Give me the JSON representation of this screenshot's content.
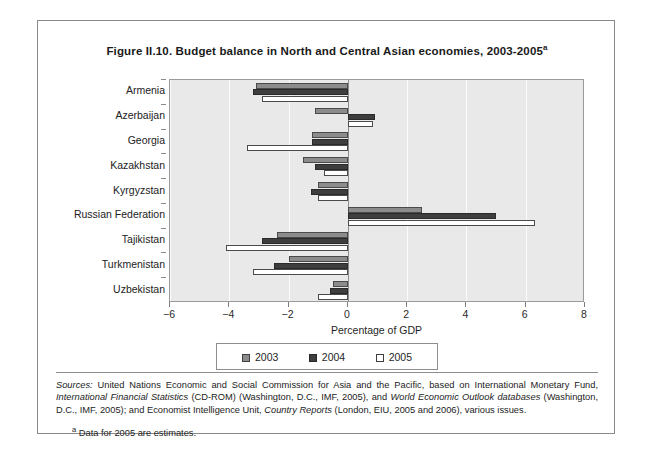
{
  "figure": {
    "title": "Figure II.10. Budget balance in North and Central Asian economies, 2003-2005",
    "title_superscript": "a"
  },
  "chart_data": {
    "type": "bar",
    "orientation": "horizontal",
    "title": "Figure II.10. Budget balance in North and Central Asian economies, 2003-2005",
    "xlabel": "Percentage of GDP",
    "ylabel": "",
    "xlim": [
      -6,
      8
    ],
    "xticks": [
      -6,
      -4,
      -2,
      0,
      2,
      4,
      6,
      8
    ],
    "xtick_labels": [
      "−6",
      "−4",
      "−2",
      "0",
      "2",
      "4",
      "6",
      "8"
    ],
    "grid": true,
    "legend_position": "bottom",
    "categories": [
      "Armenia",
      "Azerbaijan",
      "Georgia",
      "Kazakhstan",
      "Kyrgyzstan",
      "Russian Federation",
      "Tajikistan",
      "Turkmenistan",
      "Uzbekistan"
    ],
    "series": [
      {
        "name": "2003",
        "color": "#8c8c8c",
        "values": [
          -3.1,
          -1.1,
          -1.2,
          -1.5,
          -1.0,
          2.5,
          -2.4,
          -2.0,
          -0.5
        ]
      },
      {
        "name": "2004",
        "color": "#3e3e3e",
        "values": [
          -3.2,
          0.9,
          -1.2,
          -1.1,
          -1.25,
          5.0,
          -2.9,
          -2.5,
          -0.6
        ]
      },
      {
        "name": "2005",
        "color": "#ffffff",
        "values": [
          -2.9,
          0.85,
          -3.4,
          -0.8,
          -1.0,
          6.3,
          -4.1,
          -3.2,
          -1.0
        ]
      }
    ]
  },
  "legend": {
    "entries": [
      {
        "label": "2003"
      },
      {
        "label": "2004"
      },
      {
        "label": "2005"
      }
    ]
  },
  "notes": {
    "sources_label": "Sources:",
    "sources_part1": " United Nations Economic and Social Commission for Asia and the Pacific, based on International Monetary Fund, ",
    "sources_italic1": "International Financial Statistics",
    "sources_part2": " (CD-ROM) (Washington, D.C., IMF, 2005), and ",
    "sources_italic2": "World Economic Outlook databases",
    "sources_part3": " (Washington, D.C., IMF, 2005); and  Economist Intelligence Unit, ",
    "sources_italic3": "Country Reports",
    "sources_part4": " (London, EIU, 2005 and 2006), various issues.",
    "footnote_marker": "a",
    "footnote_text": " Data for 2005 are estimates."
  }
}
